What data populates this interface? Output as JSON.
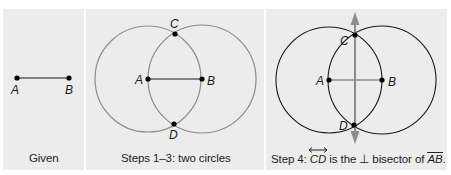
{
  "panels": [
    {
      "id": "given",
      "caption": "Given",
      "points": {
        "A": "A",
        "B": "B"
      }
    },
    {
      "id": "steps-1-3",
      "caption": "Steps 1–3: two circles",
      "points": {
        "A": "A",
        "B": "B",
        "C": "C",
        "D": "D"
      }
    },
    {
      "id": "step-4",
      "caption_prefix": "Step 4: ",
      "caption_line": "CD",
      "caption_mid": " is the ⊥ bisector of ",
      "caption_segment": "AB",
      "caption_suffix": ".",
      "points": {
        "A": "A",
        "B": "B",
        "C": "C",
        "D": "D"
      }
    }
  ],
  "colors": {
    "panel_bg": "#ececec",
    "gray_stroke": "#8c8c8c",
    "dark_stroke": "#1a1a1a",
    "arrow": "#8c8c8c"
  }
}
